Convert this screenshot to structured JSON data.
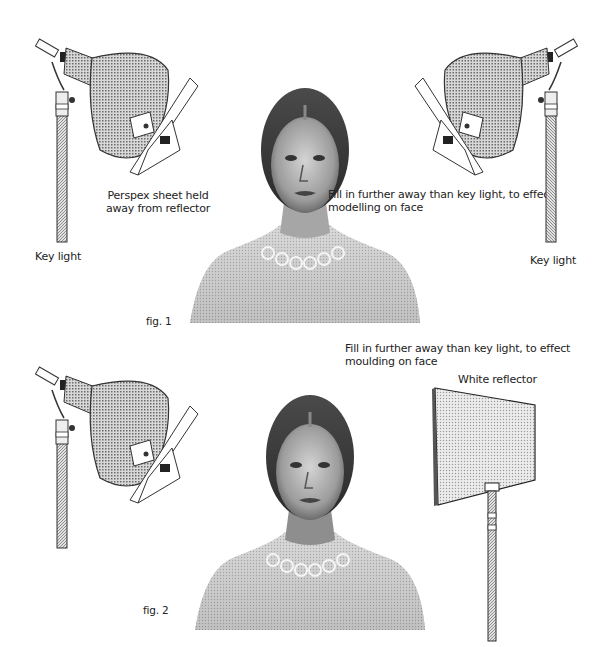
{
  "figures": [
    {
      "id": "fig1",
      "caption": "fig. 1",
      "labels": {
        "perspex_line1": "Perspex sheet held",
        "perspex_line2": "away from reflector",
        "fill_line1": "Fill in further away than key light, to effect",
        "fill_line2": "modelling on face",
        "key_light_left": "Key light",
        "key_light_right": "Key light"
      },
      "elements": [
        "key-light-lamp-left",
        "perspex-sheet-left",
        "portrait-subject",
        "key-light-lamp-right",
        "perspex-sheet-right"
      ]
    },
    {
      "id": "fig2",
      "caption": "fig. 2",
      "labels": {
        "fill_line1": "Fill in further away than key light, to effect",
        "fill_line2": "moulding on face",
        "reflector": "White reflector"
      },
      "elements": [
        "key-light-lamp-left",
        "perspex-sheet-left",
        "portrait-subject",
        "white-reflector-board"
      ]
    }
  ],
  "colors": {
    "background": "#ffffff",
    "ink": "#1a1a1a",
    "halftone": "#8a8a8a",
    "reflector_fill": "#c9c9c9"
  }
}
